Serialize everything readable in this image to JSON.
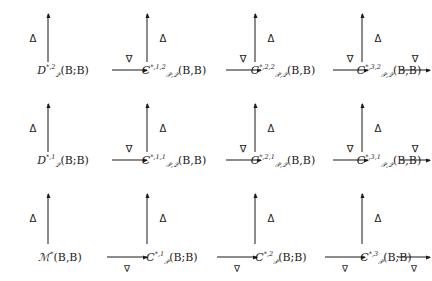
{
  "diagram": {
    "type": "commutative-diagram",
    "rows": 3,
    "columns": 4,
    "horizontal_arrow_glyph": "∇",
    "vertical_arrow_glyph": "Δ",
    "vertical_arrow_direction": "up",
    "horizontal_arrow_direction": "right",
    "nodes": [
      {
        "id": "r1c1",
        "row": 1,
        "col": 1,
        "base": "D",
        "sub": "𝒬",
        "sup": "*,2",
        "args": "(B;B)",
        "text": "D*,2_Q(B;B)"
      },
      {
        "id": "r1c2",
        "row": 1,
        "col": 2,
        "base": "C",
        "sub": "𝒫,𝒬",
        "sup": "*,1,2",
        "args": "(B,B)",
        "text": "C*,1,2_P,Q(B,B)"
      },
      {
        "id": "r1c3",
        "row": 1,
        "col": 3,
        "base": "C",
        "sub": "𝒫,𝒬",
        "sup": "*,2,2",
        "args": "(B,B)",
        "text": "C*,2,2_P,Q(B,B)"
      },
      {
        "id": "r1c4",
        "row": 1,
        "col": 4,
        "base": "C",
        "sub": "𝒫,𝒬",
        "sup": "*,3,2",
        "args": "(B,B)",
        "text": "C*,3,2_P,Q(B,B)"
      },
      {
        "id": "r2c1",
        "row": 2,
        "col": 1,
        "base": "D",
        "sub": "𝒬",
        "sup": "*,1",
        "args": "(B;B)",
        "text": "D*,1_Q(B;B)"
      },
      {
        "id": "r2c2",
        "row": 2,
        "col": 2,
        "base": "C",
        "sub": "𝒫,𝒬",
        "sup": "*,1,1",
        "args": "(B,B)",
        "text": "C*,1,1_P,Q(B,B)"
      },
      {
        "id": "r2c3",
        "row": 2,
        "col": 3,
        "base": "C",
        "sub": "𝒫,𝒬",
        "sup": "*,2,1",
        "args": "(B,B)",
        "text": "C*,2,1_P,Q(B,B)"
      },
      {
        "id": "r2c4",
        "row": 2,
        "col": 4,
        "base": "C",
        "sub": "𝒫,𝒬",
        "sup": "*,3,1",
        "args": "(B,B)",
        "text": "C*,3,1_P,Q(B,B)"
      },
      {
        "id": "r3c1",
        "row": 3,
        "col": 1,
        "base": "ℳ",
        "sub": "",
        "sup": "*",
        "args": "(B,B)",
        "text": "M*(B,B)"
      },
      {
        "id": "r3c2",
        "row": 3,
        "col": 2,
        "base": "C",
        "sub": "𝒫",
        "sup": "*,1",
        "args": "(B;B)",
        "text": "C*,1_P(B;B)"
      },
      {
        "id": "r3c3",
        "row": 3,
        "col": 3,
        "base": "C",
        "sub": "𝒫",
        "sup": "*,2",
        "args": "(B;B)",
        "text": "C*,2_P(B;B)"
      },
      {
        "id": "r3c4",
        "row": 3,
        "col": 4,
        "base": "C",
        "sub": "𝒫",
        "sup": "*,3",
        "args": "(B;B)",
        "text": "C*,3_P(B;B)"
      }
    ],
    "horizontal_arrows": [
      {
        "id": "h-r1-1",
        "row": 1,
        "from": "r1c1",
        "to": "r1c2",
        "label": "∇",
        "label_position": "above"
      },
      {
        "id": "h-r1-2",
        "row": 1,
        "from": "r1c2",
        "to": "r1c3",
        "label": "∇",
        "label_position": "above"
      },
      {
        "id": "h-r1-3",
        "row": 1,
        "from": "r1c3",
        "to": "r1c4",
        "label": "∇",
        "label_position": "above"
      },
      {
        "id": "h-r1-4",
        "row": 1,
        "from": "r1c4",
        "to": "edge-right",
        "label": "∇",
        "label_position": "above"
      },
      {
        "id": "h-r2-1",
        "row": 2,
        "from": "r2c1",
        "to": "r2c2",
        "label": "∇",
        "label_position": "above"
      },
      {
        "id": "h-r2-2",
        "row": 2,
        "from": "r2c2",
        "to": "r2c3",
        "label": "∇",
        "label_position": "above"
      },
      {
        "id": "h-r2-3",
        "row": 2,
        "from": "r2c3",
        "to": "r2c4",
        "label": "∇",
        "label_position": "above"
      },
      {
        "id": "h-r2-4",
        "row": 2,
        "from": "r2c4",
        "to": "edge-right",
        "label": "∇",
        "label_position": "above"
      },
      {
        "id": "h-r3-1",
        "row": 3,
        "from": "r3c1",
        "to": "r3c2",
        "label": "∇",
        "label_position": "below"
      },
      {
        "id": "h-r3-2",
        "row": 3,
        "from": "r3c2",
        "to": "r3c3",
        "label": "∇",
        "label_position": "below"
      },
      {
        "id": "h-r3-3",
        "row": 3,
        "from": "r3c3",
        "to": "r3c4",
        "label": "∇",
        "label_position": "below"
      },
      {
        "id": "h-r3-4",
        "row": 3,
        "from": "r3c4",
        "to": "edge-right",
        "label": "∇",
        "label_position": "below"
      }
    ],
    "vertical_arrows": [
      {
        "id": "v-c1-1",
        "col": 1,
        "from": "r3c1",
        "to": "r2c1",
        "label": "Δ",
        "label_position": "left"
      },
      {
        "id": "v-c1-2",
        "col": 1,
        "from": "r2c1",
        "to": "r1c1",
        "label": "Δ",
        "label_position": "left"
      },
      {
        "id": "v-c1-3",
        "col": 1,
        "from": "r1c1",
        "to": "edge-top",
        "label": "Δ",
        "label_position": "left"
      },
      {
        "id": "v-c2-1",
        "col": 2,
        "from": "r3c2",
        "to": "r2c2",
        "label": "Δ",
        "label_position": "right"
      },
      {
        "id": "v-c2-2",
        "col": 2,
        "from": "r2c2",
        "to": "r1c2",
        "label": "Δ",
        "label_position": "right"
      },
      {
        "id": "v-c2-3",
        "col": 2,
        "from": "r1c2",
        "to": "edge-top",
        "label": "Δ",
        "label_position": "right"
      },
      {
        "id": "v-c3-1",
        "col": 3,
        "from": "r3c3",
        "to": "r2c3",
        "label": "Δ",
        "label_position": "right"
      },
      {
        "id": "v-c3-2",
        "col": 3,
        "from": "r2c3",
        "to": "r1c3",
        "label": "Δ",
        "label_position": "right"
      },
      {
        "id": "v-c3-3",
        "col": 3,
        "from": "r1c3",
        "to": "edge-top",
        "label": "Δ",
        "label_position": "right"
      },
      {
        "id": "v-c4-1",
        "col": 4,
        "from": "r3c4",
        "to": "r2c4",
        "label": "Δ",
        "label_position": "right"
      },
      {
        "id": "v-c4-2",
        "col": 4,
        "from": "r2c4",
        "to": "r1c4",
        "label": "Δ",
        "label_position": "right"
      },
      {
        "id": "v-c4-3",
        "col": 4,
        "from": "r1c4",
        "to": "edge-top",
        "label": "Δ",
        "label_position": "right"
      }
    ]
  }
}
